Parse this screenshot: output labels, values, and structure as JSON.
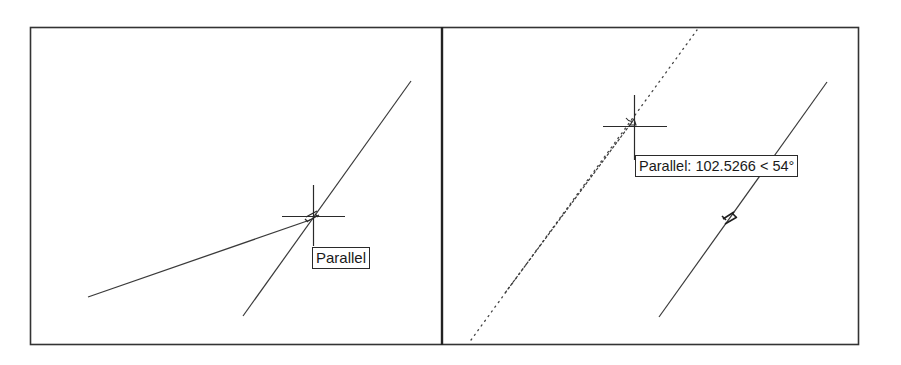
{
  "figure": {
    "panels": [
      {
        "id": "left",
        "tooltip": {
          "label": "Parallel"
        },
        "snap_mode": "parallel",
        "cursor_icon": "crosshair-icon",
        "snap_marker_icon": "parallel-snap-marker-icon"
      },
      {
        "id": "right",
        "tooltip": {
          "label": "Parallel: 102.5266 < 54°"
        },
        "snap_mode": "parallel",
        "tracking_distance": "102.5266",
        "tracking_angle": "54°",
        "cursor_icon": "crosshair-icon",
        "snap_marker_icon": "parallel-snap-marker-icon"
      }
    ],
    "colors": {
      "background": "#ffffff",
      "frame": "#333333",
      "line": "#3a3a3a",
      "tooltip_border": "#2a2a2a",
      "tooltip_text": "#1a1a1a"
    }
  }
}
